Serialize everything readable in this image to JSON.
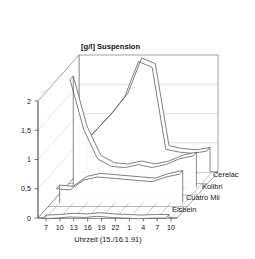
{
  "chart_data": {
    "type": "area",
    "title": "[g/l] Suspension",
    "xlabel": "Uhrzeit (15./16.1.91)",
    "ylabel": "",
    "ylim": [
      0,
      2
    ],
    "yticks": [
      "0",
      "0,5",
      "1",
      "1,5",
      "2"
    ],
    "ytick_values": [
      0,
      0.5,
      1,
      1.5,
      2
    ],
    "categories": [
      "7",
      "10",
      "13",
      "16",
      "19",
      "22",
      "1",
      "4",
      "7",
      "10"
    ],
    "grid": true,
    "legend_position": "right-depth-axis",
    "projection": "3d-ribbon",
    "series": [
      {
        "name": "Cerelac",
        "depth_index": 3,
        "values": [
          0.55,
          0.8,
          1.05,
          1.35,
          1.95,
          1.85,
          0.45,
          0.4,
          0.38,
          0.42
        ]
      },
      {
        "name": "Kolibri",
        "depth_index": 2,
        "values": [
          1.9,
          1.05,
          0.55,
          0.42,
          0.4,
          0.45,
          0.4,
          0.45,
          0.55,
          0.6
        ]
      },
      {
        "name": "Cuatro Mil",
        "depth_index": 1,
        "values": [
          0.3,
          0.28,
          0.45,
          0.5,
          0.48,
          0.46,
          0.44,
          0.42,
          0.5,
          0.55
        ]
      },
      {
        "name": "Eisbein",
        "depth_index": 0,
        "values": [
          0.05,
          0.06,
          0.08,
          0.07,
          0.09,
          0.07,
          0.06,
          0.05,
          0.06,
          0.06
        ]
      }
    ]
  },
  "colors": {
    "line": "#555555",
    "grid": "#bbbbbb",
    "axis": "#666666",
    "text": "#111111",
    "background": "#ffffff"
  }
}
